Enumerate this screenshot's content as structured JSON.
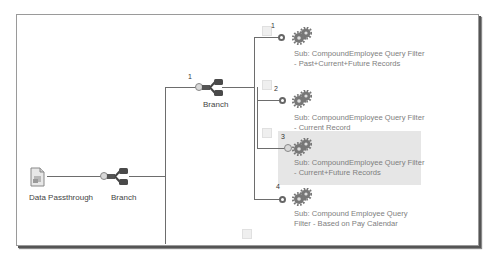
{
  "diagram": {
    "source": {
      "label": "Data Passthrough",
      "icon": "document-icon"
    },
    "branch_main": {
      "label": "Branch",
      "icon": "branch-icon"
    },
    "branch_nested": {
      "label": "Branch",
      "index": "1",
      "icon": "branch-icon"
    },
    "subprocesses": [
      {
        "index": "1",
        "label": "Sub: CompoundEmployee Query Filter - Past+Current+Future Records",
        "icon": "gears-icon",
        "highlighted": false
      },
      {
        "index": "2",
        "label": "Sub: CompoundEmployee Query Filter - Current Record",
        "icon": "gears-icon",
        "highlighted": false
      },
      {
        "index": "3",
        "label": "Sub: CompoundEmployee Query Filter - Current+Future Records",
        "icon": "gears-icon",
        "highlighted": true
      },
      {
        "index": "4",
        "label": "Sub: Compound Employee Query Filter - Based on Pay Calendar",
        "icon": "gears-icon",
        "highlighted": false
      }
    ],
    "colors": {
      "line": "#6d6d6d",
      "highlight": "#e6e6e6",
      "label_text": "#444444",
      "sub_text": "#7e7e7e"
    }
  }
}
